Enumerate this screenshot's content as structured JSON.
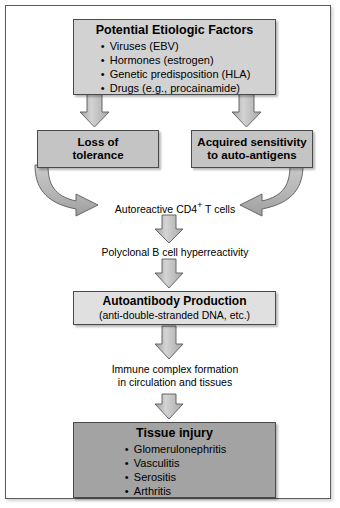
{
  "figure": {
    "colors": {
      "box_top_fill": "#d2d2d2",
      "box_mid_fill": "#c4c4c4",
      "box_light_fill": "#e0e0e0",
      "box_dark_fill": "#a3a3a3",
      "arrow_fill": "#bfbfbf",
      "stroke": "#4a4a4a",
      "frame_border": "#5b5b5b",
      "text": "#000000"
    }
  },
  "etiologic": {
    "title": "Potential Etiologic Factors",
    "items": [
      "Viruses (EBV)",
      "Hormones (estrogen)",
      "Genetic predisposition (HLA)",
      "Drugs (e.g., procainamide)"
    ]
  },
  "tolerance": {
    "line1": "Loss of",
    "line2": "tolerance"
  },
  "acquired": {
    "line1": "Acquired sensitivity",
    "line2": "to auto-antigens"
  },
  "autoreactive": {
    "text_before": "Autoreactive CD4",
    "superscript": "+",
    "text_after": " T cells"
  },
  "polyclonal": {
    "text": "Polyclonal B cell  hyperreactivity"
  },
  "autoantibody": {
    "title": "Autoantibody Production",
    "subtitle": "(anti-double-stranded DNA, etc.)"
  },
  "immune_complex": {
    "line1": "Immune complex formation",
    "line2": "in circulation and tissues"
  },
  "tissue_injury": {
    "title": "Tissue injury",
    "items": [
      "Glomerulonephritis",
      "Vasculitis",
      "Serositis",
      "Arthritis"
    ]
  },
  "arrows": [
    {
      "name": "arrow-etiologic-to-tolerance",
      "kind": "straight-down"
    },
    {
      "name": "arrow-etiologic-to-acquired",
      "kind": "straight-down"
    },
    {
      "name": "arrow-tolerance-to-autoreactive",
      "kind": "curved-right"
    },
    {
      "name": "arrow-acquired-to-autoreactive",
      "kind": "curved-left"
    },
    {
      "name": "arrow-autoreactive-to-polyclonal",
      "kind": "straight-down"
    },
    {
      "name": "arrow-polyclonal-to-autoantibody",
      "kind": "straight-down"
    },
    {
      "name": "arrow-autoantibody-to-immune",
      "kind": "straight-down"
    },
    {
      "name": "arrow-immune-to-tissue",
      "kind": "straight-down"
    }
  ]
}
